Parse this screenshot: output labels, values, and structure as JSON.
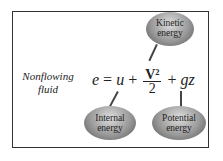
{
  "label": {
    "line1": "Nonflowing",
    "line2": "fluid"
  },
  "equation": {
    "lhs": "e",
    "eq": "=",
    "u": "u",
    "plus1": "+",
    "num": "V²",
    "den": "2",
    "plus2": "+",
    "gz": "gz"
  },
  "bubbles": {
    "kinetic": {
      "line1": "Kinetic",
      "line2": "energy"
    },
    "internal": {
      "line1": "Internal",
      "line2": "energy"
    },
    "potential": {
      "line1": "Potential",
      "line2": "energy"
    }
  }
}
